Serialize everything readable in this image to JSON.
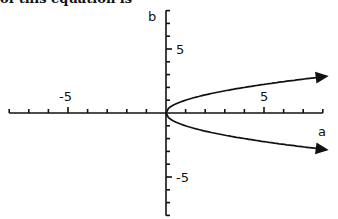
{
  "caption": "of this equation is",
  "chart_data": {
    "type": "line",
    "title": "",
    "xlabel": "a",
    "ylabel": "b",
    "xlim": [
      -8,
      8
    ],
    "ylim": [
      -8,
      8
    ],
    "x_tick_labels": [
      "-5",
      "5"
    ],
    "y_tick_labels": [
      "5",
      "-5"
    ],
    "grid": false,
    "legend": null,
    "series": [
      {
        "name": "upper branch",
        "x": [
          0,
          0.25,
          0.5,
          1,
          2,
          3,
          4,
          5,
          6,
          7,
          8
        ],
        "values": [
          0,
          0.5,
          0.71,
          1,
          1.41,
          1.73,
          2,
          2.24,
          2.45,
          2.65,
          2.83
        ],
        "arrow_end": true
      },
      {
        "name": "lower branch",
        "x": [
          0,
          0.25,
          0.5,
          1,
          2,
          3,
          4,
          5,
          6,
          7,
          8
        ],
        "values": [
          0,
          -0.5,
          -0.71,
          -1,
          -1.41,
          -1.73,
          -2,
          -2.24,
          -2.45,
          -2.65,
          -2.83
        ],
        "arrow_end": true
      }
    ]
  }
}
